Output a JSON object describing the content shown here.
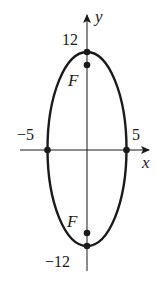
{
  "figure": {
    "type": "ellipse-graph",
    "axes": {
      "x_label": "x",
      "y_label": "y"
    },
    "ellipse": {
      "center": [
        0,
        0
      ],
      "semi_major_axis": 12,
      "semi_minor_axis": 5,
      "major_axis": "vertical"
    },
    "tick_labels": {
      "x_neg": "−5",
      "x_pos": "5",
      "y_pos": "12",
      "y_neg": "−12"
    },
    "points": [
      {
        "name": "vertex-top",
        "x": 0,
        "y": 12
      },
      {
        "name": "vertex-bottom",
        "x": 0,
        "y": -12
      },
      {
        "name": "co-vertex-left",
        "x": -5,
        "y": 0
      },
      {
        "name": "co-vertex-right",
        "x": 5,
        "y": 0
      },
      {
        "name": "focus-top",
        "label": "F"
      },
      {
        "name": "focus-bottom",
        "label": "F"
      }
    ],
    "focus_label_top": "F",
    "focus_label_bottom": "F",
    "colors": {
      "stroke": "#1a1a1a",
      "background": "#ffffff"
    }
  }
}
